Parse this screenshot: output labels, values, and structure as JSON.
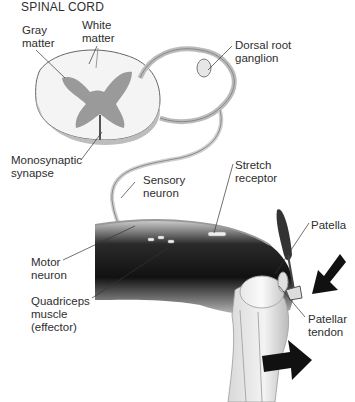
{
  "title": "SPINAL CORD",
  "labels": {
    "gray_matter": "Gray\nmatter",
    "white_matter": "White\nmatter",
    "dorsal_root_ganglion": "Dorsal root\nganglion",
    "monosynaptic_synapse": "Monosynaptic\nsynapse",
    "sensory_neuron": "Sensory\nneuron",
    "stretch_receptor": "Stretch\nreceptor",
    "patella": "Patella",
    "motor_neuron": "Motor\nneuron",
    "quadriceps": "Quadriceps\nmuscle\n(effector)",
    "patellar_tendon": "Patellar\ntendon"
  },
  "colors": {
    "gray_matter": "#9a9a9a",
    "white_matter": "#f2f2f2",
    "muscle_dark": "#1e1e1e",
    "arrow": "#111111",
    "leader_line": "#333333"
  }
}
